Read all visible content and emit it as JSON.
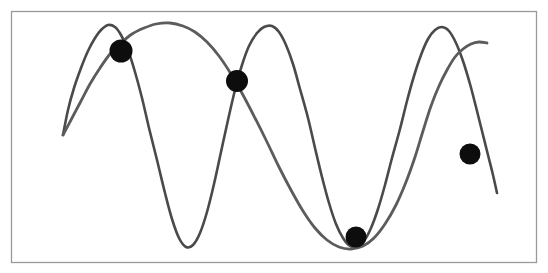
{
  "figure": {
    "width": 548,
    "height": 273,
    "background_color": "#ffffff",
    "border": {
      "name": "plot-frame",
      "x": 11,
      "y": 11,
      "width": 525,
      "height": 251,
      "stroke_color": "#9a9a9a",
      "stroke_width": 1.3
    }
  },
  "chart_data": {
    "type": "line",
    "title": "",
    "subtitle": "",
    "xlabel": "",
    "ylabel": "",
    "xlim": [
      63,
      490
    ],
    "ylim": [
      23,
      250
    ],
    "grid": false,
    "legend": null,
    "axis_ticks_visible": false,
    "tick_labels": [],
    "annotations": [],
    "series": [
      {
        "name": "curve-a",
        "stroke_color": "#4a4a4a",
        "stroke_width": 2.6,
        "points": [
          [
            63,
            135
          ],
          [
            68,
            110
          ],
          [
            74,
            88
          ],
          [
            81,
            68
          ],
          [
            88,
            51
          ],
          [
            95,
            38
          ],
          [
            101,
            30
          ],
          [
            108,
            25
          ],
          [
            115,
            27
          ],
          [
            121,
            35
          ],
          [
            128,
            50
          ],
          [
            135,
            72
          ],
          [
            142,
            98
          ],
          [
            149,
            128
          ],
          [
            157,
            160
          ],
          [
            165,
            193
          ],
          [
            172,
            219
          ],
          [
            179,
            238
          ],
          [
            186,
            247
          ],
          [
            193,
            245
          ],
          [
            200,
            233
          ],
          [
            207,
            212
          ],
          [
            214,
            184
          ],
          [
            221,
            152
          ],
          [
            228,
            120
          ],
          [
            235,
            90
          ],
          [
            242,
            65
          ],
          [
            249,
            46
          ],
          [
            257,
            33
          ],
          [
            264,
            27
          ],
          [
            272,
            26
          ],
          [
            279,
            32
          ],
          [
            286,
            45
          ],
          [
            293,
            64
          ],
          [
            300,
            89
          ],
          [
            308,
            118
          ],
          [
            315,
            148
          ],
          [
            322,
            177
          ],
          [
            329,
            203
          ],
          [
            336,
            224
          ],
          [
            343,
            238
          ],
          [
            350,
            246
          ],
          [
            357,
            247
          ],
          [
            364,
            241
          ],
          [
            371,
            228
          ],
          [
            378,
            209
          ],
          [
            385,
            185
          ],
          [
            392,
            158
          ],
          [
            400,
            129
          ],
          [
            407,
            101
          ],
          [
            414,
            76
          ],
          [
            421,
            55
          ],
          [
            428,
            39
          ],
          [
            435,
            30
          ],
          [
            442,
            27
          ],
          [
            449,
            31
          ],
          [
            456,
            43
          ],
          [
            463,
            61
          ],
          [
            470,
            84
          ],
          [
            476,
            107
          ],
          [
            482,
            131
          ],
          [
            488,
            155
          ],
          [
            493,
            175
          ],
          [
            497,
            193
          ]
        ]
      },
      {
        "name": "curve-b",
        "stroke_color": "#5c5c5c",
        "stroke_width": 2.8,
        "points": [
          [
            63,
            135
          ],
          [
            72,
            118
          ],
          [
            81,
            101
          ],
          [
            90,
            84
          ],
          [
            100,
            68
          ],
          [
            110,
            54
          ],
          [
            121,
            43
          ],
          [
            132,
            34
          ],
          [
            144,
            28
          ],
          [
            156,
            24
          ],
          [
            170,
            23
          ],
          [
            183,
            26
          ],
          [
            195,
            32
          ],
          [
            207,
            42
          ],
          [
            219,
            56
          ],
          [
            231,
            74
          ],
          [
            243,
            95
          ],
          [
            255,
            118
          ],
          [
            267,
            142
          ],
          [
            279,
            167
          ],
          [
            291,
            190
          ],
          [
            303,
            211
          ],
          [
            315,
            228
          ],
          [
            327,
            240
          ],
          [
            339,
            247
          ],
          [
            351,
            249
          ],
          [
            363,
            246
          ],
          [
            374,
            238
          ],
          [
            385,
            224
          ],
          [
            396,
            205
          ],
          [
            406,
            182
          ],
          [
            415,
            157
          ],
          [
            423,
            131
          ],
          [
            431,
            106
          ],
          [
            439,
            86
          ],
          [
            447,
            70
          ],
          [
            455,
            57
          ],
          [
            463,
            49
          ],
          [
            471,
            44
          ],
          [
            479,
            42
          ],
          [
            487,
            43
          ]
        ]
      }
    ],
    "intersection_markers": [
      {
        "name": "intersection-point-1",
        "x": 121,
        "y": 51,
        "radius": 11.5,
        "fill": "#0d0d0d"
      },
      {
        "name": "intersection-point-2",
        "x": 237,
        "y": 81,
        "radius": 11.0,
        "fill": "#0d0d0d"
      },
      {
        "name": "intersection-point-3",
        "x": 356,
        "y": 237,
        "radius": 10.5,
        "fill": "#0d0d0d"
      },
      {
        "name": "intersection-point-4",
        "x": 470,
        "y": 154,
        "radius": 10.5,
        "fill": "#0d0d0d"
      }
    ]
  }
}
